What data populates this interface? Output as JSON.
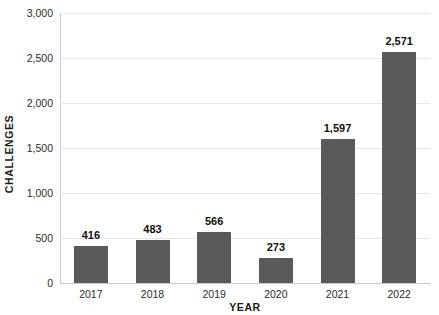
{
  "chart_data": {
    "type": "bar",
    "title": "",
    "subtitle": "",
    "xlabel": "YEAR",
    "ylabel": "CHALLENGES",
    "categories": [
      "2017",
      "2018",
      "2019",
      "2020",
      "2021",
      "2022"
    ],
    "values": [
      416,
      483,
      566,
      273,
      1597,
      2571
    ],
    "value_labels": [
      "416",
      "483",
      "566",
      "273",
      "1,597",
      "2,571"
    ],
    "ylim": [
      0,
      3000
    ],
    "ytick_values": [
      0,
      500,
      1000,
      1500,
      2000,
      2500,
      3000
    ],
    "ytick_labels": [
      "0",
      "500",
      "1,000",
      "1,500",
      "2,000",
      "2,500",
      "3,000"
    ],
    "grid": true,
    "legend": "none",
    "bar_color": "#5a5a5a",
    "gridline_color": "#e6e6e6",
    "axis_color": "#c9c9c9",
    "label_color": "#111111",
    "background": "#ffffff"
  }
}
